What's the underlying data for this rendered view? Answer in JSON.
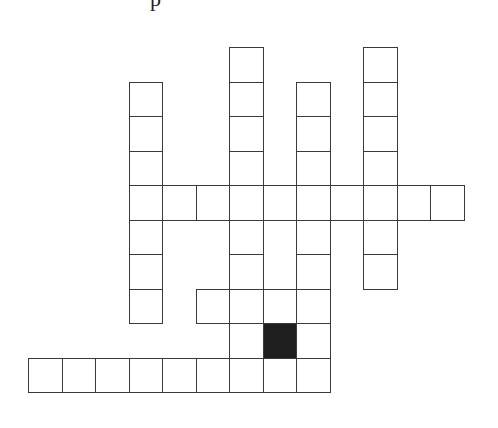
{
  "puzzle": {
    "title_fragment": "p",
    "origin": {
      "x": 28,
      "y": 47
    },
    "cell_w": 33.5,
    "cell_h": 34.5,
    "colors": {
      "border": "#3a3a3a",
      "fill": "#ffffff",
      "block": "#1e1e1e"
    },
    "cells": [
      [
        0,
        6
      ],
      [
        0,
        10
      ],
      [
        1,
        3
      ],
      [
        1,
        6
      ],
      [
        1,
        8
      ],
      [
        1,
        10
      ],
      [
        2,
        3
      ],
      [
        2,
        6
      ],
      [
        2,
        8
      ],
      [
        2,
        10
      ],
      [
        3,
        3
      ],
      [
        3,
        6
      ],
      [
        3,
        8
      ],
      [
        3,
        10
      ],
      [
        4,
        3
      ],
      [
        4,
        4
      ],
      [
        4,
        5
      ],
      [
        4,
        6
      ],
      [
        4,
        7
      ],
      [
        4,
        8
      ],
      [
        4,
        9
      ],
      [
        4,
        10
      ],
      [
        4,
        11
      ],
      [
        4,
        12
      ],
      [
        5,
        3
      ],
      [
        5,
        6
      ],
      [
        5,
        8
      ],
      [
        5,
        10
      ],
      [
        6,
        3
      ],
      [
        6,
        6
      ],
      [
        6,
        8
      ],
      [
        6,
        10
      ],
      [
        7,
        3
      ],
      [
        7,
        5
      ],
      [
        7,
        6
      ],
      [
        7,
        7
      ],
      [
        7,
        8
      ],
      [
        8,
        6
      ],
      [
        8,
        8
      ],
      [
        9,
        0
      ],
      [
        9,
        1
      ],
      [
        9,
        2
      ],
      [
        9,
        3
      ],
      [
        9,
        4
      ],
      [
        9,
        5
      ],
      [
        9,
        6
      ],
      [
        9,
        7
      ],
      [
        9,
        8
      ]
    ],
    "blocks": [
      [
        8,
        7
      ]
    ]
  }
}
